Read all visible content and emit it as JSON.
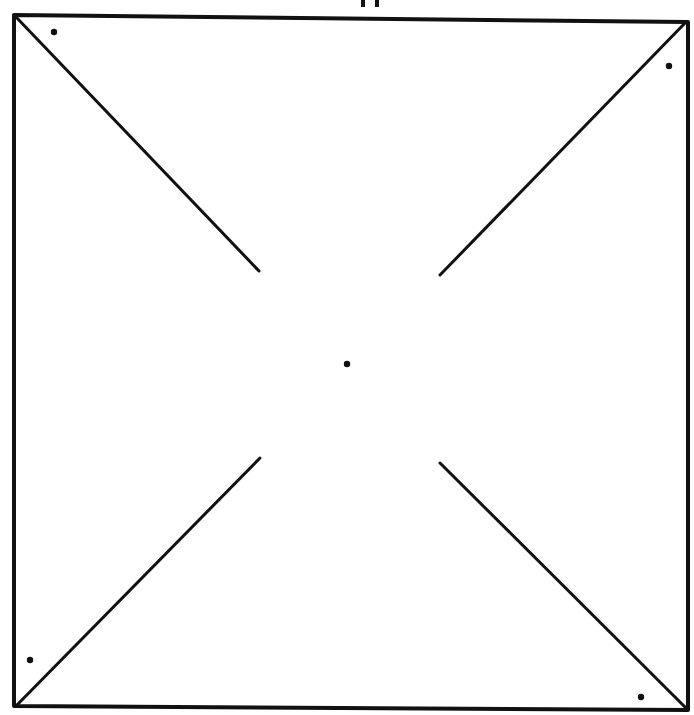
{
  "diagram": {
    "type": "pinwheel-template",
    "colors": {
      "line": "#111111",
      "background": "#ffffff"
    },
    "square": {
      "x1": 14,
      "y1": 15,
      "x2": 688,
      "y2": 22,
      "bl_x": 14,
      "bl_y": 706,
      "br_x": 688,
      "br_y": 710
    },
    "cut_lines": [
      {
        "name": "top-left-cut",
        "from": [
          16,
          17
        ],
        "to": [
          259,
          271
        ]
      },
      {
        "name": "top-right-cut",
        "from": [
          686,
          22
        ],
        "to": [
          440,
          275
        ]
      },
      {
        "name": "bottom-left-cut",
        "from": [
          16,
          706
        ],
        "to": [
          260,
          458
        ]
      },
      {
        "name": "bottom-right-cut",
        "from": [
          686,
          708
        ],
        "to": [
          440,
          463
        ]
      }
    ],
    "dots": [
      {
        "name": "top-left-dot",
        "cx": 54,
        "cy": 32
      },
      {
        "name": "top-right-dot",
        "cx": 669,
        "cy": 66
      },
      {
        "name": "center-dot",
        "cx": 347,
        "cy": 364
      },
      {
        "name": "bottom-left-dot",
        "cx": 30,
        "cy": 660
      },
      {
        "name": "bottom-right-dot",
        "cx": 641,
        "cy": 697
      }
    ],
    "top_marks": [
      {
        "x": 363,
        "y1": 0,
        "y2": 7
      },
      {
        "x": 377,
        "y1": 0,
        "y2": 7
      }
    ]
  }
}
